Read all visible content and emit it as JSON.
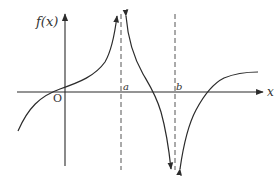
{
  "diagram": {
    "type": "function-graph",
    "labels": {
      "y_axis": "f(x)",
      "x_axis": "x",
      "origin": "O",
      "asymptote_a": "a",
      "asymptote_b": "b"
    },
    "colors": {
      "curve": "#2b2b2b",
      "axis": "#2b2b2b",
      "asymptote": "#555555",
      "background": "#ffffff"
    },
    "asymptotes": [
      {
        "name": "a",
        "style": "dashed",
        "behavior": "f → +∞ from both sides"
      },
      {
        "name": "b",
        "style": "dashed",
        "behavior": "f → −∞ from both sides"
      }
    ],
    "branches": [
      {
        "interval": "x < a",
        "behavior": "increasing, crosses x-axis left of O, rises to +∞ near a"
      },
      {
        "interval": "a < x < b",
        "behavior": "decreasing from +∞, crosses x-axis, falls to −∞ near b"
      },
      {
        "interval": "x > b",
        "behavior": "rises from −∞, crosses x-axis, levels off toward horizontal asymptote above x-axis"
      }
    ]
  }
}
